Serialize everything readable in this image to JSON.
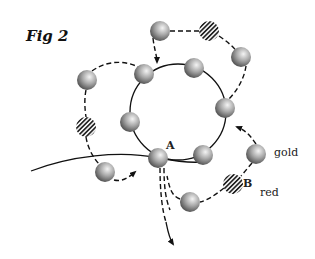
{
  "figure": {
    "title": "Fig 2",
    "labels": {
      "point_a": "A",
      "point_b": "B",
      "gold": "gold",
      "red": "red"
    },
    "colors": {
      "line": "#111111",
      "sphere_light": "#eeeeee",
      "sphere_dark": "#555555",
      "hatch": "#222222"
    },
    "circle": {
      "cx": 178,
      "cy": 112,
      "r": 48
    },
    "spheres": [
      {
        "id": "s1",
        "type": "gold",
        "cx": 160,
        "cy": 31
      },
      {
        "id": "s2",
        "type": "red",
        "cx": 209,
        "cy": 31
      },
      {
        "id": "s3",
        "type": "gold",
        "cx": 241,
        "cy": 57
      },
      {
        "id": "s4",
        "type": "gold",
        "cx": 144,
        "cy": 74
      },
      {
        "id": "s5",
        "type": "gold",
        "cx": 194,
        "cy": 68
      },
      {
        "id": "s6",
        "type": "gold",
        "cx": 87,
        "cy": 80
      },
      {
        "id": "s7",
        "type": "red",
        "cx": 86,
        "cy": 127
      },
      {
        "id": "s8",
        "type": "gold",
        "cx": 130,
        "cy": 122
      },
      {
        "id": "s9",
        "type": "gold",
        "cx": 225,
        "cy": 108
      },
      {
        "id": "s10",
        "type": "gold",
        "cx": 158,
        "cy": 158
      },
      {
        "id": "s11",
        "type": "gold",
        "cx": 203,
        "cy": 155
      },
      {
        "id": "s12",
        "type": "gold",
        "cx": 105,
        "cy": 172
      },
      {
        "id": "s13",
        "type": "gold",
        "cx": 256,
        "cy": 154
      },
      {
        "id": "s14",
        "type": "red",
        "cx": 233,
        "cy": 184
      },
      {
        "id": "s15",
        "type": "gold",
        "cx": 190,
        "cy": 202
      }
    ]
  }
}
